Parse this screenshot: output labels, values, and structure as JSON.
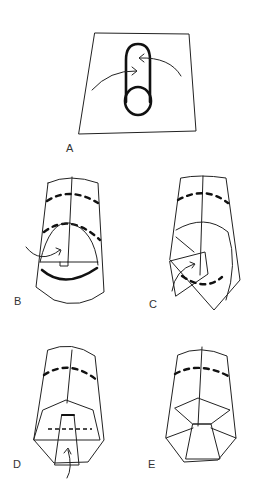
{
  "figure": {
    "type": "step-by-step folding diagram",
    "panels": [
      {
        "id": "A",
        "label": "A",
        "description": "Rolled tube placed on a square sheet; arrows indicate wrapping the sheet around the tube"
      },
      {
        "id": "B",
        "label": "B",
        "description": "Bottom flap folded up over the tube end, with dashed fold lines"
      },
      {
        "id": "C",
        "label": "C",
        "description": "Side flap folded in toward the centre"
      },
      {
        "id": "D",
        "label": "D",
        "description": "Pleated bottom with centre tab folded up along dashed line"
      },
      {
        "id": "E",
        "label": "E",
        "description": "Finished folded end"
      }
    ]
  },
  "labels": {
    "a": "A",
    "b": "B",
    "c": "C",
    "d": "D",
    "e": "E"
  },
  "colors": {
    "stroke": "#111111",
    "background": "#ffffff",
    "label": "#333333"
  }
}
